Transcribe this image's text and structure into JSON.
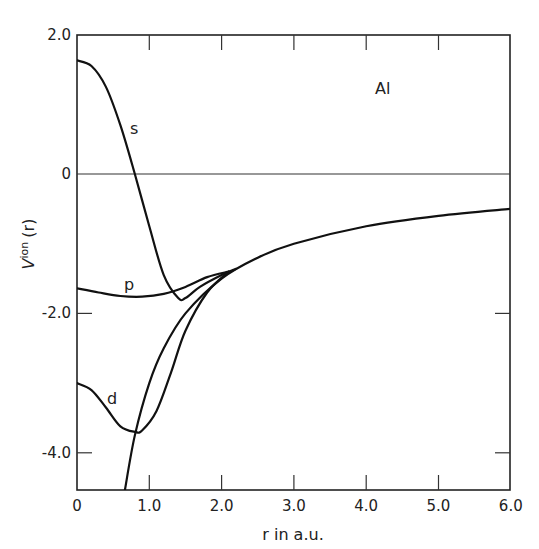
{
  "chart_data": {
    "type": "line",
    "title": "",
    "annotation": "Al",
    "xlabel": "r in a.u.",
    "ylabel": "V^ion (r)",
    "xlim": [
      0,
      6.0
    ],
    "ylim": [
      -4.5,
      2.0
    ],
    "xticks": [
      "0",
      "1.0",
      "2.0",
      "3.0",
      "4.0",
      "5.0",
      "6.0"
    ],
    "yticks": [
      "2.0",
      "0",
      "-2.0",
      "-4.0"
    ],
    "grid": false,
    "legend": "inline curve labels",
    "series": [
      {
        "name": "s",
        "label": "s",
        "x": [
          0,
          0.2,
          0.4,
          0.6,
          0.8,
          1.0,
          1.2,
          1.4,
          1.5,
          1.7,
          2.0,
          2.2
        ],
        "y": [
          1.63,
          1.55,
          1.25,
          0.7,
          0.0,
          -0.75,
          -1.45,
          -1.78,
          -1.78,
          -1.62,
          -1.45,
          -1.36
        ]
      },
      {
        "name": "p",
        "label": "p",
        "x": [
          0,
          0.3,
          0.6,
          0.9,
          1.2,
          1.5,
          1.8,
          2.1
        ],
        "y": [
          -1.64,
          -1.7,
          -1.75,
          -1.76,
          -1.72,
          -1.62,
          -1.48,
          -1.4
        ]
      },
      {
        "name": "d",
        "label": "d",
        "x": [
          0,
          0.2,
          0.4,
          0.6,
          0.8,
          0.9,
          1.1,
          1.3,
          1.5,
          1.8,
          2.1
        ],
        "y": [
          -3.0,
          -3.1,
          -3.35,
          -3.62,
          -3.7,
          -3.68,
          -3.4,
          -2.85,
          -2.25,
          -1.7,
          -1.4
        ]
      },
      {
        "name": "coulomb",
        "label": "-Z/r tail",
        "x": [
          0.66,
          0.8,
          1.0,
          1.2,
          1.5,
          2.0,
          2.5,
          3.0,
          4.0,
          5.0,
          6.0
        ],
        "y": [
          -4.55,
          -3.75,
          -3.0,
          -2.5,
          -2.0,
          -1.5,
          -1.2,
          -1.0,
          -0.75,
          -0.6,
          -0.5
        ]
      }
    ]
  }
}
